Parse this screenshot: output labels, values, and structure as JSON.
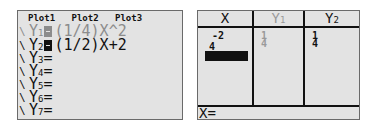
{
  "y_editor": {
    "plots": [
      "Plot1",
      "Plot2",
      "Plot3"
    ],
    "functions": [
      {
        "name": "Y",
        "sub": "1",
        "eq": "(1/4)X^2",
        "selected": false,
        "dim": true
      },
      {
        "name": "Y",
        "sub": "2",
        "eq": "(1/2)X+2",
        "selected": true,
        "dim": false
      },
      {
        "name": "Y",
        "sub": "3",
        "eq": "=",
        "dim": false
      },
      {
        "name": "Y",
        "sub": "4",
        "eq": "=",
        "dim": false
      },
      {
        "name": "Y",
        "sub": "5",
        "eq": "=",
        "dim": false
      },
      {
        "name": "Y",
        "sub": "6",
        "eq": "=",
        "dim": false
      },
      {
        "name": "Y",
        "sub": "7",
        "eq": "=",
        "dim": false
      }
    ]
  },
  "table": {
    "headers": [
      {
        "name": "X",
        "sub": ""
      },
      {
        "name": "Y",
        "sub": "1"
      },
      {
        "name": "Y",
        "sub": "2"
      }
    ],
    "columns": {
      "x": [
        "-2",
        "4"
      ],
      "y1": [
        "1",
        "4"
      ],
      "y2": [
        "1",
        "4"
      ]
    },
    "entry_line": "X="
  },
  "colors": {
    "screen_bg": "#e3e3e3",
    "ink": "#111111",
    "dim_ink": "#8c8c8c"
  }
}
